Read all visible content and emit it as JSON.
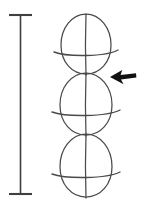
{
  "figure": {
    "background_color": "#ffffff",
    "line_color": "#4a4a4a",
    "arrow_color": "#111111",
    "scalebar_color": "#3f3f3f",
    "canvas": {
      "width": 144,
      "height": 210
    }
  },
  "scale_bar": {
    "name": "vertical-scale-bar",
    "orientation": "vertical",
    "stem_x": 20.5,
    "top_y": 15,
    "bottom_y": 194,
    "cap_half_width": 11.5,
    "cap_top_y": 15,
    "cap_bottom_y": 194,
    "length_px": 179
  },
  "ovoids": [
    {
      "name": "ovoid-top",
      "index": 1,
      "center_x": 86,
      "top_y": 14,
      "bottom_y": 74,
      "half_width": 25,
      "equator_y": 50,
      "equator_overhang": 7,
      "pointed_end": "top"
    },
    {
      "name": "ovoid-middle",
      "index": 2,
      "center_x": 86,
      "top_y": 73,
      "bottom_y": 135,
      "half_width": 26,
      "equator_y": 110,
      "equator_overhang": 8,
      "pointed_end": "top"
    },
    {
      "name": "ovoid-bottom",
      "index": 3,
      "center_x": 86,
      "top_y": 134,
      "bottom_y": 197,
      "half_width": 26,
      "equator_y": 172,
      "equator_overhang": 8,
      "pointed_end": "top"
    }
  ],
  "arrow": {
    "name": "left-pointing-arrow",
    "direction": "left",
    "tip_x": 110,
    "tip_y": 77,
    "tail_x": 136,
    "tail_y": 74,
    "points_at": "junction between ovoid-top and ovoid-middle"
  },
  "labels": {
    "scale_bar_label": "",
    "arrow_label": "",
    "caption": ""
  }
}
